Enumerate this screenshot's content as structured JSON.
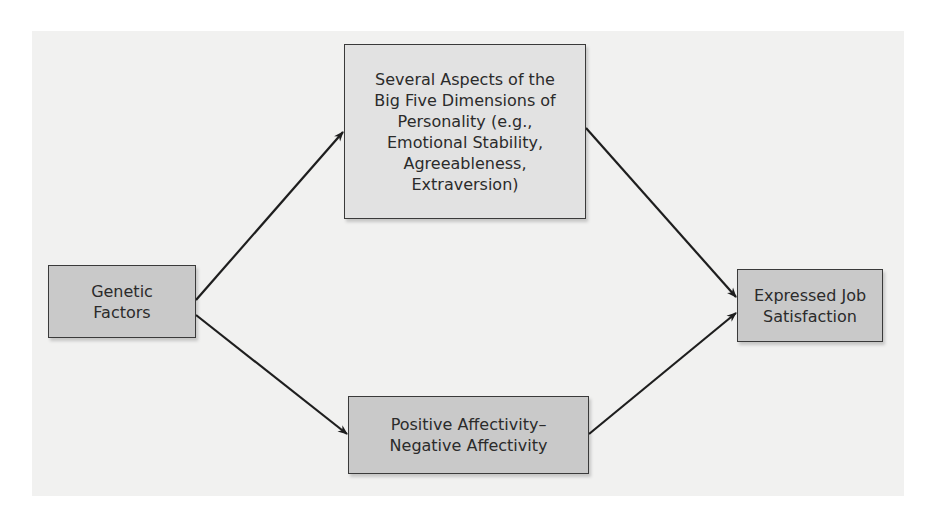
{
  "diagram": {
    "nodes": [
      {
        "id": "genetic",
        "label": "Genetic\nFactors"
      },
      {
        "id": "big_five",
        "label": "Several Aspects of the\nBig Five Dimensions of\nPersonality (e.g.,\nEmotional Stability,\nAgreeableness,\nExtraversion)"
      },
      {
        "id": "affectivity",
        "label": "Positive Affectivity–\nNegative Affectivity"
      },
      {
        "id": "job_satisfaction",
        "label": "Expressed Job\nSatisfaction"
      }
    ],
    "edges": [
      {
        "from": "genetic",
        "to": "big_five"
      },
      {
        "from": "genetic",
        "to": "affectivity"
      },
      {
        "from": "big_five",
        "to": "job_satisfaction"
      },
      {
        "from": "affectivity",
        "to": "job_satisfaction"
      }
    ],
    "colors": {
      "panel": "#f1f1f0",
      "box_light": "#e2e2e2",
      "box_mid": "#c9c9c9",
      "border": "#3a3a3a",
      "arrow": "#1e1e1e"
    }
  }
}
